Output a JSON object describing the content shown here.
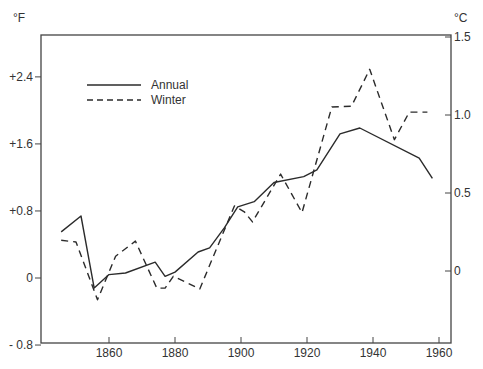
{
  "chart_data": {
    "type": "line",
    "title": "",
    "xlabel": "",
    "ylabel": "°F",
    "ylabel_right": "°C",
    "xlim": [
      1840,
      1963
    ],
    "ylim": [
      -0.8,
      2.9
    ],
    "ylim_right_ticks": [
      0,
      0.5,
      1.0,
      1.5
    ],
    "x_ticks": [
      1860,
      1880,
      1900,
      1920,
      1940,
      1960
    ],
    "x_tick_labels": [
      "1860",
      "1880",
      "1900",
      "1920",
      "1940",
      "1960"
    ],
    "y_ticks": [
      -0.8,
      0,
      0.8,
      1.6,
      2.4
    ],
    "y_tick_labels": [
      "- 0.8",
      "0",
      "+0.8",
      "+1.6",
      "+2.4"
    ],
    "y_right_tick_labels": [
      "0",
      "0.5",
      "1.0",
      "1.5"
    ],
    "grid": false,
    "legend_position": "upper-left",
    "series": [
      {
        "name": "Annual",
        "style": "solid",
        "points": [
          [
            1845.5,
            0.55
          ],
          [
            1851.5,
            0.74
          ],
          [
            1855.5,
            -0.12
          ],
          [
            1860,
            0.04
          ],
          [
            1865,
            0.06
          ],
          [
            1874,
            0.19
          ],
          [
            1877,
            0.02
          ],
          [
            1880,
            0.07
          ],
          [
            1887,
            0.31
          ],
          [
            1890.5,
            0.36
          ],
          [
            1895,
            0.6
          ],
          [
            1899,
            0.85
          ],
          [
            1904,
            0.91
          ],
          [
            1910,
            1.14
          ],
          [
            1919,
            1.21
          ],
          [
            1923,
            1.29
          ],
          [
            1930,
            1.72
          ],
          [
            1936,
            1.79
          ],
          [
            1954,
            1.43
          ],
          [
            1958,
            1.19
          ]
        ]
      },
      {
        "name": "Winter",
        "style": "dashed",
        "points": [
          [
            1845.5,
            0.45
          ],
          [
            1850,
            0.43
          ],
          [
            1856.5,
            -0.26
          ],
          [
            1862,
            0.26
          ],
          [
            1868,
            0.44
          ],
          [
            1874.5,
            -0.12
          ],
          [
            1877,
            -0.12
          ],
          [
            1879.5,
            0.02
          ],
          [
            1887.5,
            -0.13
          ],
          [
            1898,
            0.86
          ],
          [
            1901,
            0.79
          ],
          [
            1903.5,
            0.67
          ],
          [
            1912,
            1.24
          ],
          [
            1918.5,
            0.78
          ],
          [
            1927.5,
            2.04
          ],
          [
            1933.5,
            2.05
          ],
          [
            1939,
            2.49
          ],
          [
            1946.5,
            1.65
          ],
          [
            1951,
            1.98
          ],
          [
            1956.5,
            1.98
          ]
        ]
      }
    ]
  },
  "axes": {
    "left_unit": "°F",
    "right_unit": "°C"
  },
  "legend": {
    "items": [
      {
        "label": "Annual",
        "style": "solid"
      },
      {
        "label": "Winter",
        "style": "dashed"
      }
    ]
  },
  "colors": {
    "line": "#2b2b2b",
    "axis": "#444444",
    "text": "#333333"
  }
}
